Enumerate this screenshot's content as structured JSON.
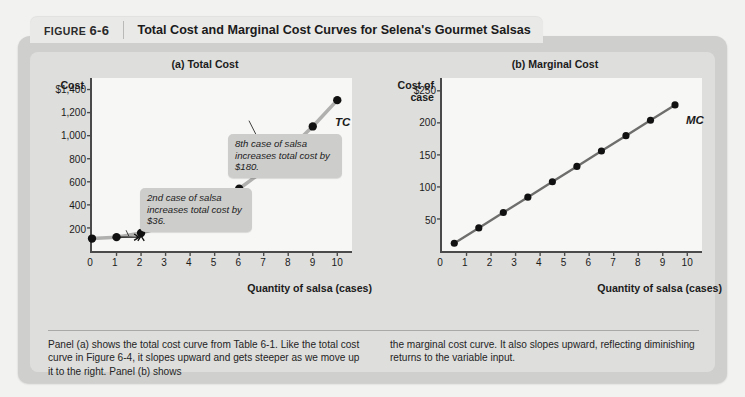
{
  "figure": {
    "badge_prefix": "FIGURE",
    "badge_number": "6-6",
    "title": "Total Cost and Marginal Cost Curves for Selena's Gourmet Salsas"
  },
  "caption": {
    "left": "Panel (a) shows the total cost curve from Table 6-1. Like the total cost curve in Figure 6-4, it slopes upward and gets steeper as we move up it to the right. Panel (b) shows",
    "right": "the marginal cost curve. It also slopes upward, reflecting diminishing returns to the variable input."
  },
  "annotations": {
    "note_2nd": "2nd case of salsa increases total cost by $36.",
    "note_8th": "8th case of salsa increases total cost by $180."
  },
  "colors": {
    "page_background": "#f2f2f1",
    "panel_background": "#cfcfcd",
    "panel_inner": "#dededc",
    "header_tab": "#e9e9e7",
    "plot_background": "#f7f7f5",
    "axis": "#4a4a4a",
    "tc_curve": "#b0b0ae",
    "mc_curve": "#6e6e6c",
    "marker": "#111111",
    "callout_background": "#cdcdcb"
  },
  "chart_data": [
    {
      "type": "line",
      "id": "total-cost",
      "title": "(a) Total Cost",
      "xlabel": "Quantity of salsa (cases)",
      "ylabel": "Cost",
      "series_label": "TC",
      "x": [
        0,
        1,
        2,
        3,
        4,
        5,
        6,
        7,
        8,
        9,
        10
      ],
      "values": [
        108,
        120,
        156,
        216,
        300,
        408,
        540,
        696,
        876,
        1080,
        1308
      ],
      "xlim": [
        0,
        10.6
      ],
      "ylim": [
        0,
        1500
      ],
      "xticks": [
        "0",
        "1",
        "2",
        "3",
        "4",
        "5",
        "6",
        "7",
        "8",
        "9",
        "10"
      ],
      "yticks": [
        "$1,400",
        "1,200",
        "1,000",
        "800",
        "600",
        "400",
        "200"
      ],
      "ytick_values": [
        1400,
        1200,
        1000,
        800,
        600,
        400,
        200
      ],
      "grid": false,
      "legend": "none"
    },
    {
      "type": "line",
      "id": "marginal-cost",
      "title": "(b) Marginal Cost",
      "xlabel": "Quantity of salsa (cases)",
      "ylabel": "Cost of case",
      "series_label": "MC",
      "x": [
        0.5,
        1.5,
        2.5,
        3.5,
        4.5,
        5.5,
        6.5,
        7.5,
        8.5,
        9.5
      ],
      "values": [
        12,
        36,
        60,
        84,
        108,
        132,
        156,
        180,
        204,
        228
      ],
      "xlim": [
        0,
        10.6
      ],
      "ylim": [
        0,
        270
      ],
      "xticks": [
        "0",
        "1",
        "2",
        "3",
        "4",
        "5",
        "6",
        "7",
        "8",
        "9",
        "10"
      ],
      "yticks": [
        "$250",
        "200",
        "150",
        "100",
        "50"
      ],
      "ytick_values": [
        250,
        200,
        150,
        100,
        50
      ],
      "grid": false,
      "legend": "none"
    }
  ]
}
